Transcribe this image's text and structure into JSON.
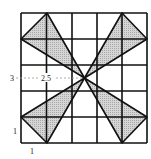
{
  "diagram": {
    "grid": {
      "cols": 5,
      "rows": 5,
      "x0": 21,
      "y0": 13,
      "x1": 147,
      "y1": 143
    },
    "center": {
      "x": 84.5,
      "y": 78
    },
    "triangles": [
      {
        "name": "top-left",
        "points": [
          [
            21,
            39
          ],
          [
            47,
            13
          ],
          [
            84.5,
            78
          ]
        ]
      },
      {
        "name": "top-right",
        "points": [
          [
            147,
            39
          ],
          [
            122,
            13
          ],
          [
            84.5,
            78
          ]
        ]
      },
      {
        "name": "bottom-left",
        "points": [
          [
            21,
            117
          ],
          [
            47,
            143
          ],
          [
            84.5,
            78
          ]
        ]
      },
      {
        "name": "bottom-right",
        "points": [
          [
            147,
            117
          ],
          [
            122,
            143
          ],
          [
            84.5,
            78
          ]
        ]
      }
    ],
    "labels": {
      "y_center": "3",
      "x_center": "2.5",
      "y_unit": "1",
      "x_unit": "1"
    },
    "colors": {
      "fill": "#c8c8c8",
      "stroke": "#111111",
      "dash": "#999999"
    }
  }
}
